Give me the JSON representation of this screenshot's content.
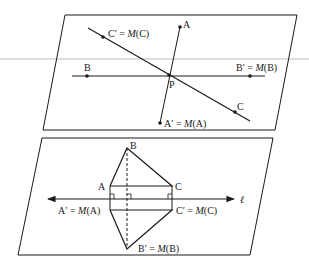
{
  "figure": {
    "top_panel": {
      "labels": {
        "A": "A",
        "B": "B",
        "C": "C",
        "P": "P",
        "c_prime": "C′ = ",
        "c_prime_M": "M",
        "c_prime_arg": "(C)",
        "b_prime": "B′ = ",
        "b_prime_M": "M",
        "b_prime_arg": "(B)",
        "a_prime": "A′ = ",
        "a_prime_M": "M",
        "a_prime_arg": "(A)"
      }
    },
    "bottom_panel": {
      "labels": {
        "A": "A",
        "B": "B",
        "C": "C",
        "line": "ℓ",
        "a_prime": "A′ = ",
        "a_prime_M": "M",
        "a_prime_arg": "(A)",
        "c_prime": "C′ = ",
        "c_prime_M": "M",
        "c_prime_arg": "(C)",
        "b_prime": "B′ = ",
        "b_prime_M": "M",
        "b_prime_arg": "(B)"
      }
    },
    "colors": {
      "ink": "#1a1a1a",
      "artifact_line": "#bdbdbd",
      "background": "#ffffff"
    }
  }
}
